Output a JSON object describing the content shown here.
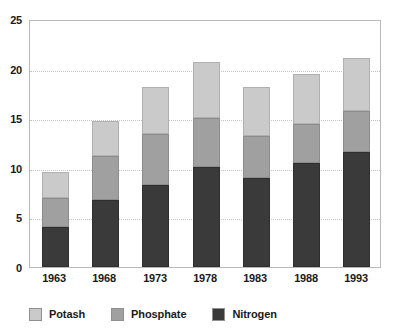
{
  "chart_data": {
    "type": "bar",
    "subtype": "stacked-vertical",
    "title": "",
    "xlabel": "",
    "ylabel": "",
    "categories": [
      "1963",
      "1968",
      "1973",
      "1978",
      "1983",
      "1988",
      "1993"
    ],
    "series": [
      {
        "name": "Nitrogen",
        "color": "#3a3a3a",
        "values": [
          4.0,
          6.8,
          8.3,
          10.1,
          9.0,
          10.5,
          11.6
        ]
      },
      {
        "name": "Phosphate",
        "color": "#a0a0a0",
        "values": [
          3.0,
          4.4,
          5.1,
          4.9,
          4.2,
          3.9,
          4.1
        ]
      },
      {
        "name": "Potash",
        "color": "#cacaca",
        "values": [
          2.6,
          3.5,
          4.7,
          5.7,
          4.9,
          5.1,
          5.4
        ]
      }
    ],
    "stack_order_bottom_to_top": [
      "Nitrogen",
      "Phosphate",
      "Potash"
    ],
    "totals": [
      9.6,
      14.7,
      18.1,
      20.7,
      18.1,
      19.5,
      21.1
    ],
    "ylim": [
      0,
      25
    ],
    "yticks": [
      0,
      5,
      10,
      15,
      20,
      25
    ],
    "ytick_labels": [
      "0",
      "5",
      "10",
      "15",
      "20",
      "25"
    ],
    "grid": {
      "horizontal": true,
      "style": "dotted",
      "color": "#c4c4c4",
      "at_values": [
        5,
        10,
        15,
        20
      ]
    },
    "legend": {
      "position": "bottom",
      "orientation": "horizontal",
      "entries": [
        {
          "label": "Potash",
          "color": "#cacaca"
        },
        {
          "label": "Phosphate",
          "color": "#a0a0a0"
        },
        {
          "label": "Nitrogen",
          "color": "#3a3a3a"
        }
      ]
    },
    "plot_border_color": "#b9b9b9",
    "background": "#ffffff"
  }
}
